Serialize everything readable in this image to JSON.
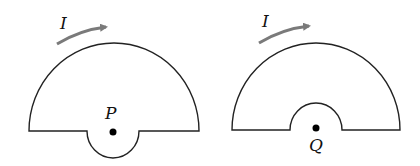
{
  "figures": [
    {
      "id": "left",
      "current_label": "I",
      "point_label": "P",
      "notch": "outward semicircle below center"
    },
    {
      "id": "right",
      "current_label": "I",
      "point_label": "Q",
      "notch": "inward semicircle above center"
    }
  ],
  "colors": {
    "wire": "#222222",
    "arrow": "#7a7a7a",
    "point": "#000000"
  }
}
